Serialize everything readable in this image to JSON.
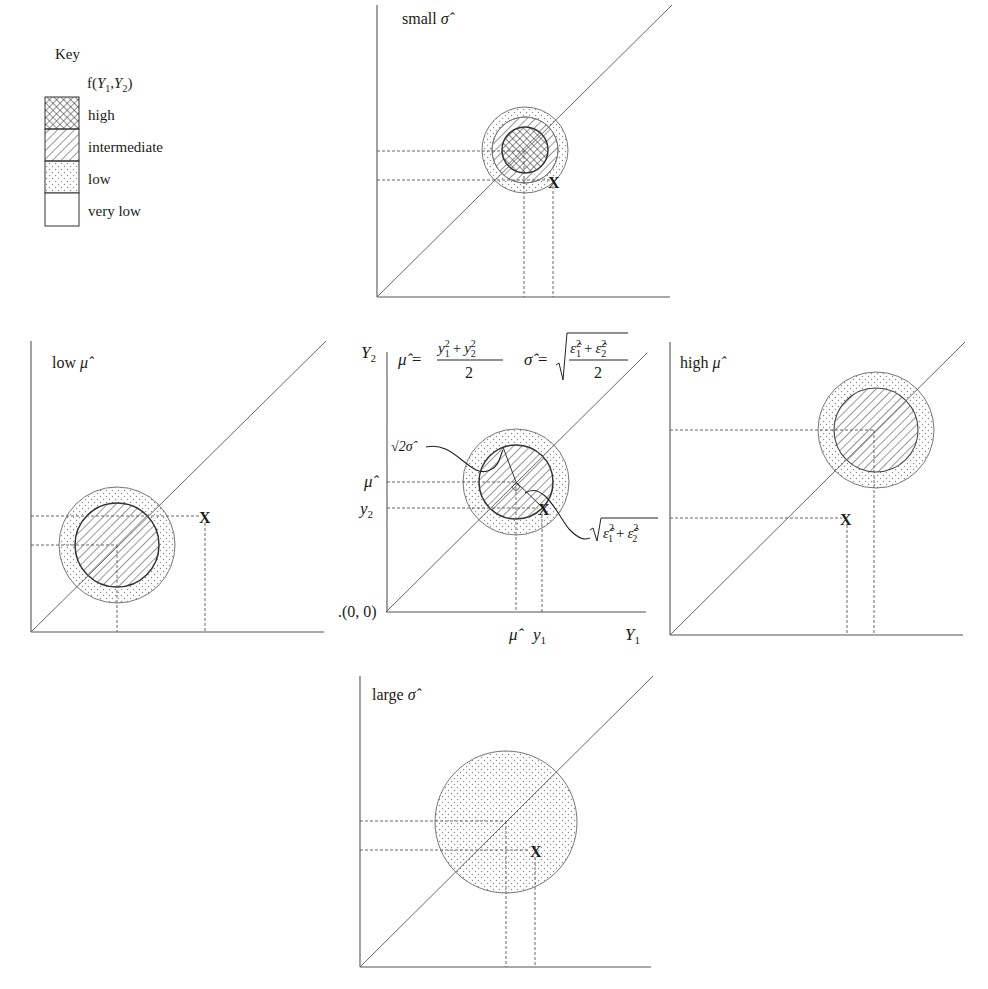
{
  "key": {
    "title": "Key",
    "subtitle_prefix": "f(",
    "subtitle_y1": "Y",
    "subtitle_sub1": "1",
    "subtitle_comma": ",",
    "subtitle_y2": "Y",
    "subtitle_sub2": "2",
    "subtitle_suffix": ")",
    "items": [
      {
        "label": "high",
        "pattern": "crosshatch"
      },
      {
        "label": "intermediate",
        "pattern": "diagonal-hatch"
      },
      {
        "label": "low",
        "pattern": "dots"
      },
      {
        "label": "very low",
        "pattern": "blank"
      }
    ]
  },
  "panels": {
    "small_sigma": {
      "title": "small",
      "title_symbol": "σ̂",
      "point_label": "X"
    },
    "low_mu": {
      "title": "low",
      "title_symbol": "μ̂",
      "point_label": "X"
    },
    "high_mu": {
      "title": "high",
      "title_symbol": "μ̂",
      "point_label": "X"
    },
    "large_sigma": {
      "title": "large",
      "title_symbol": "σ̂",
      "point_label": "X"
    },
    "center": {
      "y_axis_label": "Y",
      "y_axis_sub": "2",
      "x_axis_label": "Y",
      "x_axis_sub": "1",
      "origin_label": ".(0, 0)",
      "mu_hat_label": "μ̂",
      "y2_label": "y",
      "y2_sub": "2",
      "y1_label": "y",
      "y1_sub": "1",
      "point_label": "X",
      "radius_label": "√2σ̂",
      "distance_label_eps1": "ε̂",
      "distance_label_eps2": "ε̂",
      "distance_label_plus": "+",
      "sup2": "2",
      "sub1": "1",
      "sub2": "2",
      "formula_mu_lhs": "μ̂ =",
      "formula_mu_num_y": "y",
      "formula_mu_num_plus": "+",
      "formula_mu_den": "2",
      "formula_sigma_lhs": "σ̂ =",
      "formula_sigma_den": "2"
    }
  },
  "colors": {
    "ink": "#1a1a1a",
    "axis": "#555555",
    "background": "#ffffff"
  }
}
